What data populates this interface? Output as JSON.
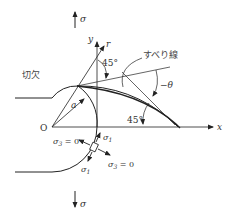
{
  "labels": {
    "sigma_top": "σ",
    "sigma_bottom": "σ",
    "notch": "切欠",
    "slip_line": "すべり線",
    "origin": "O",
    "x_axis": "x",
    "y_axis": "y",
    "r_axis": "r",
    "radius": "a",
    "angle_top": "45°",
    "angle_bottom": "45°",
    "angle_theta": "−θ",
    "sigma1_upper": "σ",
    "sigma1_upper_sub": "1",
    "sigma1_lower": "σ",
    "sigma1_lower_sub": "1",
    "sigma3_left": "σ",
    "sigma3_left_sub": "3",
    "sigma3_left_eq": " = 0",
    "sigma3_right": "σ",
    "sigma3_right_sub": "3",
    "sigma3_right_eq": " = 0"
  },
  "colors": {
    "line": "#222222",
    "text": "#333333",
    "background": "#ffffff"
  }
}
